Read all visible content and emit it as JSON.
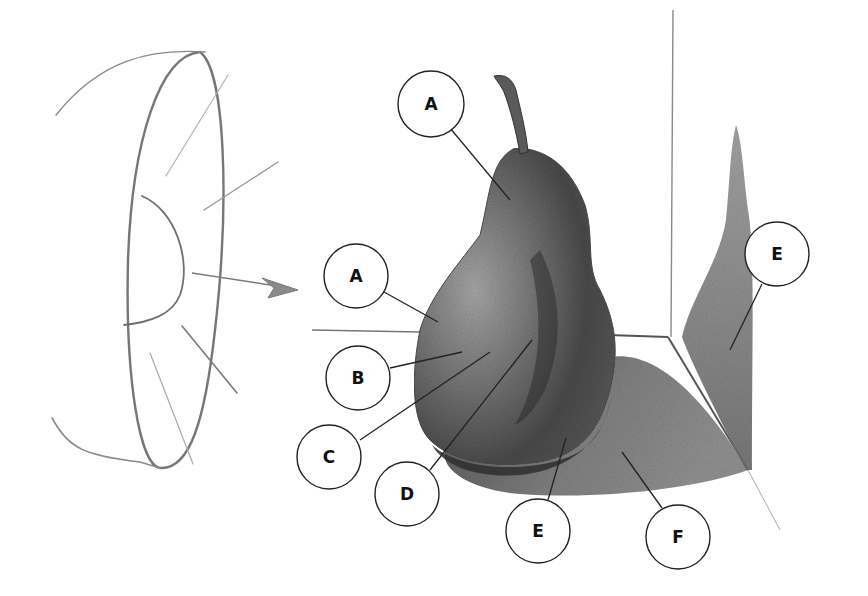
{
  "diagram": {
    "light_source": {
      "icon": "lamp-reflector-icon",
      "direction": "arrow pointing right toward pear"
    },
    "callouts": [
      {
        "letter": "A",
        "cx": 431,
        "cy": 104,
        "target": [
          510,
          200
        ]
      },
      {
        "letter": "A",
        "cx": 356,
        "cy": 276,
        "target": [
          438,
          322
        ]
      },
      {
        "letter": "B",
        "cx": 358,
        "cy": 378,
        "target": [
          462,
          352
        ]
      },
      {
        "letter": "C",
        "cx": 329,
        "cy": 457,
        "target": [
          490,
          352
        ]
      },
      {
        "letter": "D",
        "cx": 407,
        "cy": 494,
        "target": [
          532,
          340
        ]
      },
      {
        "letter": "E",
        "cx": 538,
        "cy": 531,
        "target": [
          566,
          438
        ]
      },
      {
        "letter": "F",
        "cx": 678,
        "cy": 537,
        "target": [
          622,
          452
        ]
      },
      {
        "letter": "E",
        "cx": 777,
        "cy": 254,
        "target": [
          730,
          350
        ]
      }
    ],
    "colors": {
      "background": "#ffffff",
      "ink": "#222222",
      "graphite_dark": "#3a3a3a",
      "graphite_mid": "#6e6e6e",
      "graphite_light": "#a9a9a9"
    }
  }
}
